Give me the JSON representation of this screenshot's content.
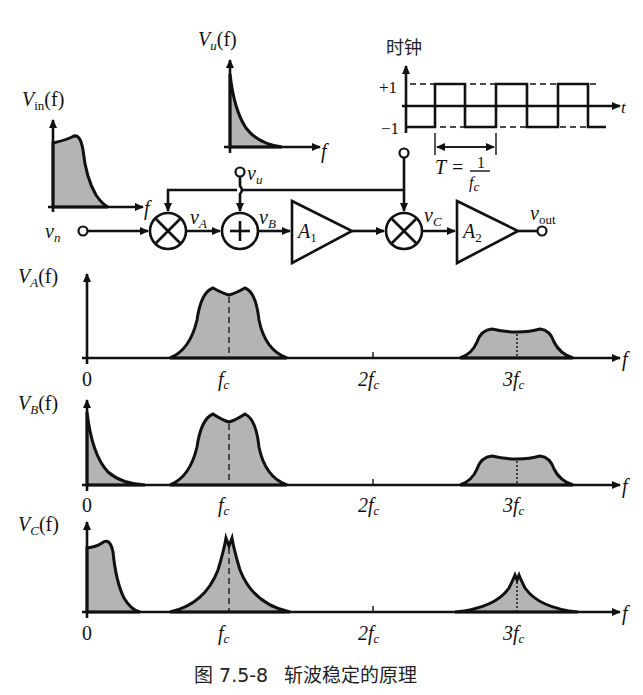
{
  "figure": {
    "caption": "图 7.5-8   斩波稳定的原理",
    "caption_label": "图 7.5-8",
    "caption_title": "斩波稳定的原理"
  },
  "insets": {
    "vin": {
      "label_main": "V",
      "label_sub": "in",
      "label_arg": "(f)",
      "x_label": "f"
    },
    "vu": {
      "label_main": "V",
      "label_sub": "u",
      "label_arg": "(f)",
      "x_label": "f"
    },
    "clock": {
      "title": "时钟",
      "y_high": "+1",
      "y_low": "−1",
      "x_label": "t",
      "period_label": "T =",
      "period_num": "1",
      "period_den_main": "f",
      "period_den_sub": "c"
    }
  },
  "circuit": {
    "input": {
      "label_main": "v",
      "label_sub": "n"
    },
    "offset_input": {
      "label_main": "v",
      "label_sub": "u"
    },
    "node_a": {
      "label_main": "v",
      "label_sub": "A"
    },
    "node_b": {
      "label_main": "v",
      "label_sub": "B"
    },
    "node_c": {
      "label_main": "v",
      "label_sub": "C"
    },
    "amp1": {
      "label_main": "A",
      "label_sub": "1"
    },
    "amp2": {
      "label_main": "A",
      "label_sub": "2"
    },
    "output": {
      "label_main": "v",
      "label_sub": "out"
    },
    "mixer1_symbol": "multiplier",
    "adder_symbol": "summer",
    "mixer2_symbol": "multiplier"
  },
  "spectra": [
    {
      "id": "VA",
      "label_main": "V",
      "label_sub": "A",
      "label_arg": "(f)",
      "ticks": [
        "0",
        "f",
        "2f",
        "3f"
      ],
      "tick_sub": "c",
      "x_label": "f"
    },
    {
      "id": "VB",
      "label_main": "V",
      "label_sub": "B",
      "label_arg": "(f)",
      "ticks": [
        "0",
        "f",
        "2f",
        "3f"
      ],
      "tick_sub": "c",
      "x_label": "f"
    },
    {
      "id": "VC",
      "label_main": "V",
      "label_sub": "C",
      "label_arg": "(f)",
      "ticks": [
        "0",
        "f",
        "2f",
        "3f"
      ],
      "tick_sub": "c",
      "x_label": "f"
    }
  ],
  "colors": {
    "fill": "#b4b4b4",
    "stroke": "#111111"
  }
}
